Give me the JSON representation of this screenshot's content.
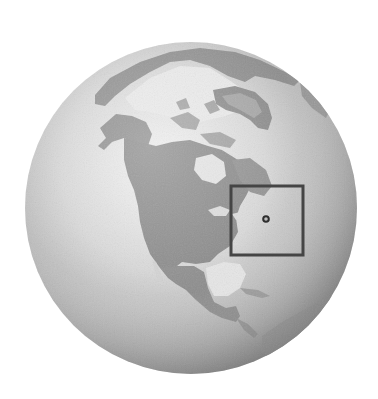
{
  "map": {
    "title": "North America locator globe",
    "projection": "orthographic",
    "style": "grayscale shaded relief",
    "regions": [
      {
        "name": "Greenland"
      },
      {
        "name": "Arctic Ocean"
      },
      {
        "name": "Canadian Arctic Archipelago"
      },
      {
        "name": "Alaska"
      },
      {
        "name": "Canada"
      },
      {
        "name": "Hudson Bay"
      },
      {
        "name": "United States"
      },
      {
        "name": "Gulf of Mexico"
      },
      {
        "name": "Mexico"
      },
      {
        "name": "Central America"
      },
      {
        "name": "South America (north)"
      },
      {
        "name": "Siberia"
      }
    ],
    "highlight": {
      "type": "locator-box",
      "region": "northeastern United States",
      "marker": "location-point"
    },
    "colors": {
      "background": "#ffffff",
      "ocean_light": "#eeeeee",
      "ocean_dark": "#8f8f8f",
      "land": "#8a8a8a",
      "land_light": "#a9a9a9",
      "ice": "#e6e6e6",
      "box_stroke": "#454545",
      "marker": "#333333"
    }
  }
}
